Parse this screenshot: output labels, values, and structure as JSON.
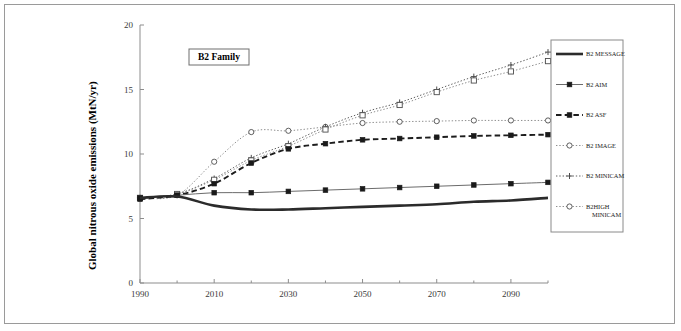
{
  "figure": {
    "annotation_box": "B2 Family",
    "frame_border_color": "#9a9a9a",
    "background": "#ffffff"
  },
  "chart_data": {
    "type": "line",
    "title": "B2 Family",
    "xlabel": "",
    "ylabel": "Global nitrous oxide emissions (MtN/yr)",
    "xlim": [
      1990,
      2100
    ],
    "ylim": [
      0,
      20
    ],
    "grid": false,
    "legend_position": "right-outside",
    "x_major_ticks": [
      1990,
      2010,
      2030,
      2050,
      2070,
      2090
    ],
    "x_major_tick_labels": [
      "1990",
      "2010",
      "2030",
      "2050",
      "2070",
      "2090"
    ],
    "x_minor_ticks": [
      2000,
      2020,
      2040,
      2060,
      2080,
      2100
    ],
    "y_ticks": [
      0,
      5,
      10,
      15,
      20
    ],
    "y_tick_labels": [
      "0",
      "5",
      "10",
      "15",
      "20"
    ],
    "x": [
      1990,
      2000,
      2010,
      2020,
      2030,
      2040,
      2050,
      2060,
      2070,
      2080,
      2090,
      2100
    ],
    "series": [
      {
        "name": "B2 MESSAGE",
        "marker": "none",
        "line": "solid-thick",
        "color": "#2b2b2b",
        "values": [
          6.6,
          6.7,
          6.0,
          5.7,
          5.7,
          5.8,
          5.9,
          6.0,
          6.1,
          6.3,
          6.4,
          6.6
        ]
      },
      {
        "name": "B2 AIM",
        "marker": "filled-square",
        "line": "solid-thin",
        "color": "#5a5a5a",
        "values": [
          6.6,
          6.8,
          7.0,
          7.0,
          7.1,
          7.2,
          7.3,
          7.4,
          7.5,
          7.6,
          7.7,
          7.8
        ]
      },
      {
        "name": "B2 ASF",
        "marker": "filled-square",
        "line": "dashed",
        "color": "#1d1d1d",
        "values": [
          6.5,
          6.8,
          7.7,
          9.3,
          10.4,
          10.8,
          11.1,
          11.2,
          11.3,
          11.4,
          11.45,
          11.5
        ]
      },
      {
        "name": "B2 IMAGE",
        "marker": "open-circle",
        "line": "dotted",
        "color": "#8e8e8e",
        "values": [
          6.6,
          6.8,
          9.4,
          11.7,
          11.8,
          12.1,
          12.4,
          12.5,
          12.55,
          12.6,
          12.6,
          12.6
        ]
      },
      {
        "name": "B2 MINICAM",
        "marker": "plus",
        "line": "dotted",
        "color": "#5f5f5f",
        "values": [
          6.6,
          6.9,
          8.1,
          9.7,
          10.8,
          12.1,
          13.2,
          14.0,
          15.0,
          16.0,
          16.9,
          17.9
        ]
      },
      {
        "name": "B2HIGH MINICAM",
        "marker": "open-square",
        "line": "dotted",
        "color": "#8e8e8e",
        "values": [
          6.6,
          6.9,
          8.0,
          9.5,
          10.6,
          11.9,
          13.0,
          13.8,
          14.8,
          15.7,
          16.4,
          17.2
        ]
      }
    ]
  },
  "legend": {
    "items": [
      {
        "label": "B2 MESSAGE",
        "marker": "none",
        "line": "solid-thick"
      },
      {
        "label": "B2 AIM",
        "marker": "filled-square",
        "line": "solid-thin"
      },
      {
        "label": "B2 ASF",
        "marker": "filled-square",
        "line": "dashed"
      },
      {
        "label": "B2 IMAGE",
        "marker": "open-circle",
        "line": "dotted"
      },
      {
        "label": "B2 MINICAM",
        "marker": "plus",
        "line": "dotted"
      },
      {
        "label": "B2HIGH",
        "label2": "MINICAM",
        "marker": "open-circle",
        "line": "dotted"
      }
    ]
  }
}
